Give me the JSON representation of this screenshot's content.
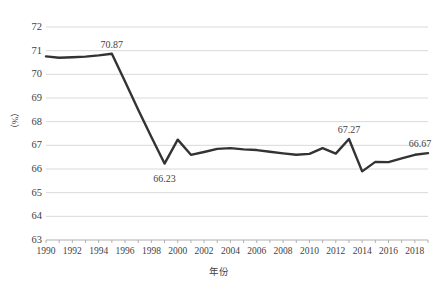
{
  "chart_data": {
    "type": "line",
    "title": "",
    "xlabel": "年份",
    "ylabel": "（%）",
    "ylim": [
      63,
      72
    ],
    "xlim": [
      1990,
      2019
    ],
    "grid": true,
    "legend": "none",
    "ytick_labels": [
      "72",
      "71",
      "70",
      "69",
      "68",
      "67",
      "66",
      "65",
      "64",
      "63"
    ],
    "ytick_values": [
      72,
      71,
      70,
      69,
      68,
      67,
      66,
      65,
      64,
      63
    ],
    "xtick_labels": [
      "1990",
      "1992",
      "1994",
      "1996",
      "1998",
      "2000",
      "2002",
      "2004",
      "2006",
      "2008",
      "2010",
      "2012",
      "2014",
      "2016",
      "2018"
    ],
    "xtick_values": [
      1990,
      1992,
      1994,
      1996,
      1998,
      2000,
      2002,
      2004,
      2006,
      2008,
      2010,
      2012,
      2014,
      2016,
      2018
    ],
    "line_color": "#333333",
    "grid_color": "#d9d9d9",
    "x": [
      1990,
      1991,
      1992,
      1993,
      1994,
      1995,
      1996,
      1997,
      1998,
      1999,
      2000,
      2001,
      2002,
      2003,
      2004,
      2005,
      2006,
      2007,
      2008,
      2009,
      2010,
      2011,
      2012,
      2013,
      2014,
      2015,
      2016,
      2017,
      2018,
      2019
    ],
    "values": [
      70.76,
      70.7,
      70.72,
      70.75,
      70.8,
      70.87,
      69.7,
      68.5,
      67.35,
      66.23,
      67.24,
      66.6,
      66.72,
      66.85,
      66.88,
      66.83,
      66.8,
      66.73,
      66.66,
      66.6,
      66.64,
      66.88,
      66.65,
      67.27,
      65.9,
      66.3,
      66.29,
      66.45,
      66.6,
      66.67
    ],
    "annotations": [
      {
        "label": "70.87",
        "x": 1995,
        "y": 70.87
      },
      {
        "label": "66.23",
        "x": 1999,
        "y": 66.23
      },
      {
        "label": "67.27",
        "x": 2013,
        "y": 67.27
      },
      {
        "label": "66.67",
        "x": 2019,
        "y": 66.67
      }
    ]
  }
}
